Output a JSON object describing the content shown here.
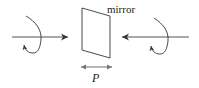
{
  "diagram": {
    "labels": {
      "mirror": "mirror",
      "p": "P"
    },
    "colors": {
      "stroke": "#333333",
      "arrow_axis": "#555555",
      "double_arrow": "#888888",
      "background": "#ffffff"
    },
    "elements": [
      {
        "id": "left-incoming-arrow",
        "direction": "right",
        "from": [
          12,
          37
        ],
        "to": [
          69,
          37
        ]
      },
      {
        "id": "left-rotation-curl",
        "sense": "circular-polarization",
        "arrowhead": "up"
      },
      {
        "id": "mirror-plane",
        "shape": "parallelogram",
        "corners": [
          [
            82,
            8
          ],
          [
            110,
            16
          ],
          [
            110,
            58
          ],
          [
            82,
            50
          ]
        ]
      },
      {
        "id": "right-incoming-arrow",
        "direction": "left",
        "from": [
          189,
          37
        ],
        "to": [
          121,
          37
        ]
      },
      {
        "id": "right-rotation-curl",
        "sense": "circular-polarization",
        "arrowhead": "up"
      },
      {
        "id": "parity-double-arrow",
        "from": [
          80,
          67
        ],
        "to": [
          113,
          67
        ]
      }
    ]
  }
}
